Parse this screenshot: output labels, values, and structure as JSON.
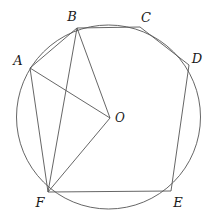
{
  "figure": {
    "kind": "circle-inscribed-hexagon-diagram",
    "width": 212,
    "height": 223,
    "background_color": "#ffffff",
    "stroke_color": "#555555",
    "label_color": "#1a1a1a",
    "stroke_width": 0.9
  },
  "circle": {
    "name": "circumscribed-circle",
    "center": {
      "x": 108.5,
      "y": 117
    },
    "radius": 92,
    "center_point_label": "O",
    "center_label_x": 120,
    "center_label_y": 118
  },
  "vertices": [
    {
      "id": "A",
      "label": "A",
      "x": 30,
      "y": 68,
      "label_x": 18,
      "label_y": 60
    },
    {
      "id": "B",
      "label": "B",
      "x": 77,
      "y": 28,
      "label_x": 72,
      "label_y": 16
    },
    {
      "id": "C",
      "label": "C",
      "x": 140,
      "y": 27,
      "label_x": 146,
      "label_y": 17
    },
    {
      "id": "D",
      "label": "D",
      "x": 189,
      "y": 65,
      "label_x": 197,
      "label_y": 58
    },
    {
      "id": "E",
      "label": "E",
      "x": 171,
      "y": 191,
      "label_x": 178,
      "label_y": 202
    },
    {
      "id": "F",
      "label": "F",
      "x": 48,
      "y": 192,
      "label_x": 40,
      "label_y": 202
    }
  ],
  "center": {
    "id": "O",
    "label": "O",
    "x": 110,
    "y": 118
  },
  "segments": [
    {
      "name": "chord-A-B",
      "from": "A",
      "to": "B",
      "x1": 30,
      "y1": 68,
      "x2": 77,
      "y2": 28
    },
    {
      "name": "chord-B-C",
      "from": "B",
      "to": "C",
      "x1": 77,
      "y1": 28,
      "x2": 140,
      "y2": 27
    },
    {
      "name": "chord-C-D",
      "from": "C",
      "to": "D",
      "x1": 140,
      "y1": 27,
      "x2": 189,
      "y2": 65
    },
    {
      "name": "chord-D-E",
      "from": "D",
      "to": "E",
      "x1": 189,
      "y1": 65,
      "x2": 171,
      "y2": 191
    },
    {
      "name": "chord-E-F",
      "from": "E",
      "to": "F",
      "x1": 171,
      "y1": 191,
      "x2": 48,
      "y2": 192
    },
    {
      "name": "chord-F-A",
      "from": "F",
      "to": "A",
      "x1": 48,
      "y1": 192,
      "x2": 30,
      "y2": 68
    },
    {
      "name": "chord-B-F",
      "from": "B",
      "to": "F",
      "x1": 77,
      "y1": 28,
      "x2": 48,
      "y2": 192
    },
    {
      "name": "radius-O-A",
      "from": "O",
      "to": "A",
      "x1": 110,
      "y1": 118,
      "x2": 30,
      "y2": 68
    },
    {
      "name": "radius-O-B",
      "from": "O",
      "to": "B",
      "x1": 110,
      "y1": 118,
      "x2": 77,
      "y2": 28
    },
    {
      "name": "radius-O-F",
      "from": "O",
      "to": "F",
      "x1": 110,
      "y1": 118,
      "x2": 48,
      "y2": 192
    }
  ]
}
